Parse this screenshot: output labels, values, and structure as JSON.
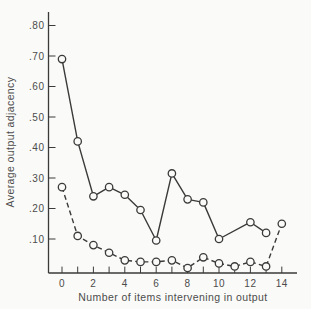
{
  "figure": {
    "background": "#fafaf8",
    "line_color": "#3a3a3a",
    "text_color": "#4c4c4c"
  },
  "chart_data": {
    "type": "line",
    "title": "",
    "xlabel": "Number of items intervening in output",
    "ylabel": "Average output adjacency",
    "x_tick_labels": [
      "0",
      "2",
      "4",
      "6",
      "8",
      "10",
      "12",
      "14"
    ],
    "x_minor_ticks": [
      1,
      3,
      5,
      7,
      9,
      11,
      13
    ],
    "y_tick_labels": [
      ".10",
      ".20",
      ".30",
      ".40",
      ".50",
      ".60",
      ".70",
      ".80"
    ],
    "xlim": [
      -1,
      15
    ],
    "ylim": [
      0,
      0.85
    ],
    "grid": false,
    "legend": null,
    "series": [
      {
        "name": "solid-line",
        "style": "solid",
        "marker": "open-circle",
        "x": [
          0,
          1,
          2,
          3,
          4,
          5,
          6,
          7,
          8,
          9,
          10,
          12,
          13
        ],
        "values": [
          0.69,
          0.42,
          0.24,
          0.27,
          0.245,
          0.195,
          0.095,
          0.315,
          0.23,
          0.22,
          0.1,
          0.155,
          0.12
        ]
      },
      {
        "name": "dashed-line",
        "style": "dashed",
        "marker": "open-circle",
        "x": [
          0,
          1,
          2,
          3,
          4,
          5,
          6,
          7,
          8,
          9,
          10,
          11,
          12,
          13,
          14
        ],
        "values": [
          0.27,
          0.11,
          0.08,
          0.055,
          0.03,
          0.025,
          0.025,
          0.03,
          0.005,
          0.04,
          0.02,
          0.01,
          0.025,
          0.01,
          0.15
        ]
      }
    ]
  }
}
